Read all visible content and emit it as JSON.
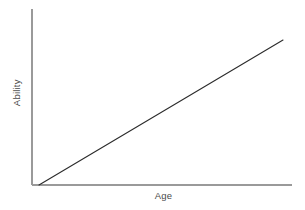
{
  "chart_data": {
    "type": "line",
    "title": "",
    "subtitle": "",
    "xlabel": "Age",
    "ylabel": "Ability",
    "x": [
      0,
      1
    ],
    "series": [
      {
        "name": "Ability",
        "values": [
          0,
          1
        ],
        "color": "#2b2b2b"
      }
    ],
    "xlim": [
      0,
      1
    ],
    "ylim": [
      0,
      1
    ],
    "xticks": [],
    "yticks": [],
    "xticklabels": [],
    "yticklabels": [],
    "grid": false,
    "legend": false,
    "legend_position": "none",
    "annotations": [],
    "axis_color": "#9a9a9a",
    "background_color": "#ffffff",
    "line_color": "#2b2b2b",
    "label_color": "#4a4a4a"
  },
  "geometry": {
    "axis_x": 32,
    "axis_y_top": 9,
    "axis_y_bottom": 185,
    "axis_x_right": 292,
    "line_start_x": 39,
    "line_start_y": 185,
    "line_end_x": 283,
    "line_end_y": 40
  }
}
